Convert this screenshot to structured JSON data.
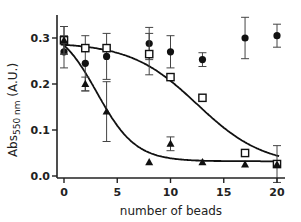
{
  "chart_data": {
    "type": "scatter",
    "title": "",
    "xlabel": "number of beads",
    "ylabel": "Abs550 nm (A.U.)",
    "ylabel_parts": {
      "main": "Abs",
      "subscript": "550 nm",
      "suffix": " (A.U.)"
    },
    "xlim": [
      -0.5,
      21
    ],
    "ylim": [
      0.0,
      0.35
    ],
    "xticks": [
      0,
      5,
      10,
      15,
      20
    ],
    "xtick_labels": [
      "0",
      "5",
      "10",
      "15",
      "20"
    ],
    "yticks": [
      0.0,
      0.1,
      0.2,
      0.3
    ],
    "ytick_labels": [
      "0.0",
      "0.1",
      "0.2",
      "0.3"
    ],
    "grid": false,
    "legend": null,
    "series": [
      {
        "name": "filled circles",
        "marker": "circle-filled",
        "x": [
          0,
          2,
          4,
          8,
          10,
          13,
          17,
          20
        ],
        "y": [
          0.27,
          0.245,
          0.26,
          0.288,
          0.27,
          0.253,
          0.3,
          0.305
        ],
        "err": [
          0.035,
          0.06,
          0.05,
          0.035,
          0.035,
          0.015,
          0.045,
          0.025
        ],
        "fit": null
      },
      {
        "name": "open squares",
        "marker": "square-open",
        "x": [
          0,
          2,
          4,
          8,
          10,
          13,
          17,
          20
        ],
        "y": [
          0.295,
          0.278,
          0.278,
          0.265,
          0.215,
          0.17,
          0.05,
          0.026
        ],
        "err": [
          0.03,
          0.0,
          0.0,
          0.045,
          0.0,
          0.0,
          0.0,
          0.04
        ],
        "fit": {
          "type": "sigmoid",
          "top": 0.29,
          "bottom": 0.022,
          "x50": 12.5,
          "slope": 0.32
        }
      },
      {
        "name": "filled triangles",
        "marker": "triangle-filled",
        "x": [
          0,
          2,
          4,
          8,
          10,
          13,
          17,
          20
        ],
        "y": [
          0.295,
          0.2,
          0.14,
          0.03,
          0.07,
          0.03,
          0.025,
          0.025
        ],
        "err": [
          0.03,
          0.015,
          0.065,
          0.0,
          0.015,
          0.0,
          0.0,
          0.0
        ],
        "fit": {
          "type": "sigmoid",
          "top": 0.33,
          "bottom": 0.032,
          "x50": 3.1,
          "slope": 0.55
        }
      }
    ]
  }
}
